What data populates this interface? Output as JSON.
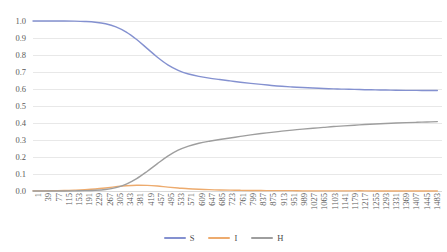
{
  "chart_data": {
    "type": "line",
    "title": "",
    "subtitle": "",
    "xlabel": "",
    "ylabel": "",
    "xlim": [
      1,
      1500
    ],
    "ylim": [
      0.0,
      1.0
    ],
    "grid": true,
    "legend_position": "bottom",
    "y_ticks": [
      "0.0",
      "0.1",
      "0.2",
      "0.3",
      "0.4",
      "0.5",
      "0.6",
      "0.7",
      "0.8",
      "0.9",
      "1.0"
    ],
    "x_ticks": [
      "1",
      "39",
      "77",
      "115",
      "153",
      "191",
      "229",
      "267",
      "305",
      "343",
      "381",
      "419",
      "457",
      "495",
      "533",
      "571",
      "609",
      "647",
      "685",
      "723",
      "761",
      "799",
      "837",
      "875",
      "913",
      "951",
      "989",
      "1027",
      "1065",
      "1103",
      "1141",
      "1179",
      "1217",
      "1255",
      "1293",
      "1331",
      "1369",
      "1407",
      "1445",
      "1483"
    ],
    "x": [
      1,
      39,
      77,
      115,
      153,
      191,
      229,
      267,
      305,
      343,
      381,
      419,
      457,
      495,
      533,
      571,
      609,
      647,
      685,
      723,
      761,
      799,
      837,
      875,
      913,
      951,
      989,
      1027,
      1065,
      1103,
      1141,
      1179,
      1217,
      1255,
      1293,
      1331,
      1369,
      1407,
      1445,
      1483
    ],
    "series": [
      {
        "name": "S",
        "color": "#8491d0",
        "values": [
          1.0,
          1.0,
          1.0,
          1.0,
          0.999,
          0.997,
          0.993,
          0.984,
          0.966,
          0.935,
          0.891,
          0.839,
          0.787,
          0.742,
          0.71,
          0.688,
          0.674,
          0.664,
          0.656,
          0.648,
          0.64,
          0.633,
          0.627,
          0.621,
          0.616,
          0.612,
          0.609,
          0.606,
          0.603,
          0.601,
          0.599,
          0.598,
          0.596,
          0.595,
          0.594,
          0.593,
          0.592,
          0.592,
          0.591,
          0.591
        ]
      },
      {
        "name": "I",
        "color": "#edab6e",
        "values": [
          0.001,
          0.001,
          0.002,
          0.003,
          0.005,
          0.008,
          0.012,
          0.018,
          0.025,
          0.031,
          0.034,
          0.033,
          0.029,
          0.023,
          0.018,
          0.013,
          0.01,
          0.008,
          0.006,
          0.005,
          0.004,
          0.003,
          0.003,
          0.002,
          0.002,
          0.002,
          0.001,
          0.001,
          0.001,
          0.001,
          0.001,
          0.001,
          0.001,
          0.0,
          0.0,
          0.0,
          0.0,
          0.0,
          0.0,
          0.0
        ]
      },
      {
        "name": "H",
        "color": "#9e9e9e",
        "values": [
          0.0,
          0.0,
          0.0,
          0.0,
          0.001,
          0.002,
          0.004,
          0.009,
          0.02,
          0.041,
          0.073,
          0.115,
          0.161,
          0.205,
          0.24,
          0.264,
          0.281,
          0.293,
          0.303,
          0.312,
          0.321,
          0.33,
          0.338,
          0.345,
          0.352,
          0.358,
          0.364,
          0.369,
          0.374,
          0.379,
          0.383,
          0.387,
          0.391,
          0.394,
          0.397,
          0.4,
          0.402,
          0.404,
          0.406,
          0.408
        ]
      }
    ],
    "legend": [
      {
        "label": "S",
        "color": "#8491d0"
      },
      {
        "label": "I",
        "color": "#edab6e"
      },
      {
        "label": "H",
        "color": "#9e9e9e"
      }
    ],
    "colors": {
      "series_s": "#8491d0",
      "series_i": "#edab6e",
      "series_h": "#9e9e9e",
      "gridline": "#e8e8e8",
      "axis_text": "#5a5a5a",
      "background": "#ffffff"
    }
  }
}
